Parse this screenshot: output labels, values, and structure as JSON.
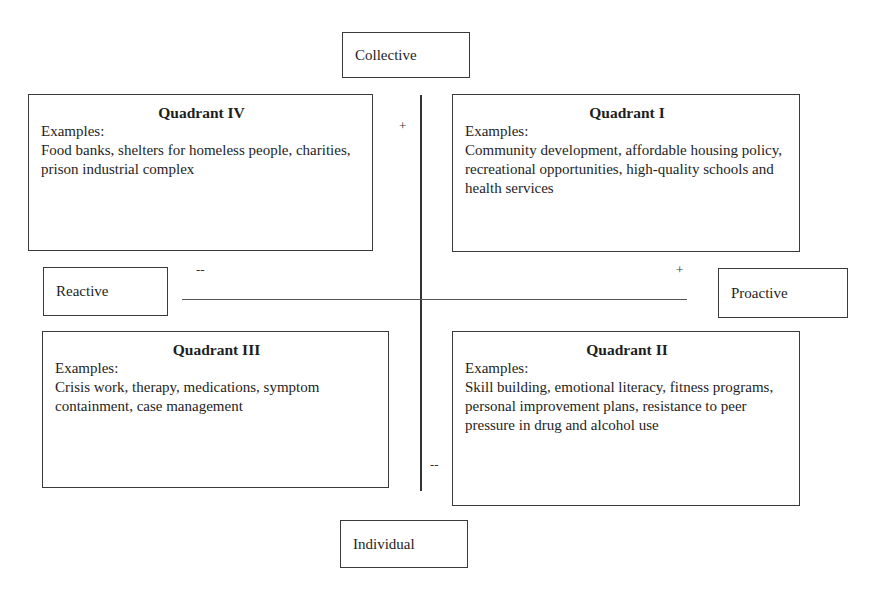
{
  "axes": {
    "top": "Collective",
    "bottom": "Individual",
    "left": "Reactive",
    "right": "Proactive"
  },
  "signs": {
    "top": "+",
    "bottom": "--",
    "left": "--",
    "right": "+"
  },
  "quadrants": {
    "q4": {
      "title": "Quadrant IV",
      "examples_label": "Examples:",
      "examples": "Food banks, shelters for homeless people, charities, prison industrial complex"
    },
    "q1": {
      "title": "Quadrant I",
      "examples_label": "Examples:",
      "examples": "Community development, affordable housing policy, recreational opportunities, high-quality schools and health services"
    },
    "q3": {
      "title": "Quadrant III",
      "examples_label": "Examples:",
      "examples": "Crisis work, therapy, medications, symptom containment, case management"
    },
    "q2": {
      "title": "Quadrant II",
      "examples_label": "Examples:",
      "examples": "Skill building, emotional literacy, fitness programs, personal improvement plans, resistance to peer pressure in drug and alcohol use"
    }
  }
}
